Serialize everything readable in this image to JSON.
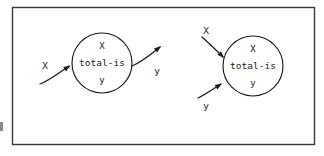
{
  "figure": {
    "frame": {
      "name": "diagram-border"
    },
    "margin_mark": {
      "name": "scan-artifact"
    },
    "nodes": [
      {
        "id": "left-node",
        "line1": "X",
        "line2": "total-is",
        "line3": "y",
        "cx": 102,
        "cy": 63,
        "r": 30
      },
      {
        "id": "right-node",
        "line1": "X",
        "line2": "total-is",
        "line3": "y",
        "cx": 253,
        "cy": 66,
        "r": 30
      }
    ],
    "edges": [
      {
        "id": "left-input-x",
        "label": "X",
        "direction": "in",
        "label_x": 45,
        "label_y": 66,
        "path": "M 40 84 C 50 80 60 72 69 66",
        "arrow_x": 70.5,
        "arrow_y": 65.5,
        "arrow_angle": -32
      },
      {
        "id": "left-output-y",
        "label": "y",
        "direction": "out",
        "label_x": 157,
        "label_y": 71,
        "path": "M 132 66 C 142 62 150 55 160 47",
        "arrow_x": 161,
        "arrow_y": 46,
        "arrow_angle": -40
      },
      {
        "id": "right-input-x",
        "label": "X",
        "direction": "in",
        "label_x": 206,
        "label_y": 31,
        "path": "M 202 37 C 210 44 216 50 223 57",
        "arrow_x": 224,
        "arrow_y": 58,
        "arrow_angle": 46
      },
      {
        "id": "right-input-y",
        "label": "y",
        "direction": "in",
        "label_x": 206,
        "label_y": 106,
        "path": "M 198 98 C 206 94 213 89 221 84",
        "arrow_x": 222,
        "arrow_y": 83.5,
        "arrow_angle": -32
      }
    ]
  },
  "colors": {
    "ink": "#1c1c1c",
    "frame": "#3a3a3a",
    "paper": "#ffffff"
  }
}
